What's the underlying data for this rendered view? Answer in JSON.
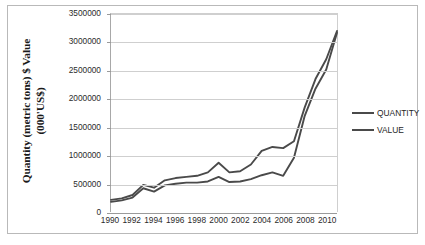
{
  "chart_data": {
    "type": "line",
    "title": "",
    "xlabel": "",
    "ylabel_line1": "Quantity  (metric tons) $ Value",
    "ylabel_line2": "(000'US$)",
    "grid": true,
    "legend_position": "right",
    "ylim": [
      0,
      3500000
    ],
    "ytick_values": [
      3500000,
      3000000,
      2500000,
      2000000,
      1500000,
      1000000,
      500000,
      0
    ],
    "ytick_labels": [
      "3500000",
      "3000000",
      "2500000",
      "2000000",
      "1500000",
      "1000000",
      "500000",
      "0"
    ],
    "xtick_labels": [
      "1990",
      "1992",
      "1994",
      "1996",
      "1998",
      "2000",
      "2002",
      "2004",
      "2006",
      "2008",
      "2010"
    ],
    "x": [
      1990,
      1991,
      1992,
      1993,
      1994,
      1995,
      1996,
      1997,
      1998,
      1999,
      2000,
      2001,
      2002,
      2003,
      2004,
      2005,
      2006,
      2007,
      2008,
      2009,
      2010,
      2011
    ],
    "series": [
      {
        "name": "QUANTITY",
        "color": "#4a4a4a",
        "values": [
          215000,
          240000,
          300000,
          480000,
          430000,
          560000,
          600000,
          620000,
          640000,
          700000,
          870000,
          700000,
          720000,
          840000,
          1080000,
          1150000,
          1130000,
          1250000,
          1850000,
          2350000,
          2700000,
          3200000
        ]
      },
      {
        "name": "VALUE",
        "color": "#4a4a4a",
        "values": [
          180000,
          205000,
          255000,
          420000,
          360000,
          470000,
          500000,
          520000,
          520000,
          540000,
          620000,
          530000,
          540000,
          580000,
          650000,
          700000,
          640000,
          960000,
          1700000,
          2180000,
          2520000,
          3170000
        ]
      }
    ]
  },
  "legend": {
    "entries": [
      {
        "label": "QUANTITY"
      },
      {
        "label": "VALUE"
      }
    ]
  }
}
